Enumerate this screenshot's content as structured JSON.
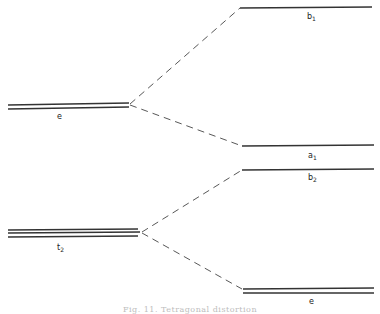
{
  "diagram": {
    "type": "energy-level splitting diagram",
    "left_levels": [
      {
        "id": "e",
        "label": "e",
        "degeneracy": 2
      },
      {
        "id": "t2",
        "label": "t",
        "subscript": "2",
        "degeneracy": 3
      }
    ],
    "right_levels": [
      {
        "id": "b1",
        "label": "b",
        "subscript": "1",
        "degeneracy": 1,
        "from": "e"
      },
      {
        "id": "a1",
        "label": "a",
        "subscript": "1",
        "degeneracy": 1,
        "from": "e"
      },
      {
        "id": "b2",
        "label": "b",
        "subscript": "2",
        "degeneracy": 1,
        "from": "t2"
      },
      {
        "id": "e2",
        "label": "e",
        "degeneracy": 2,
        "from": "t2"
      }
    ],
    "connectors": "dashed",
    "caption": "Fig. 11. Tetragonal distortion"
  },
  "colors": {
    "line": "#333333",
    "text": "#222222",
    "caption": "#bdbdbd"
  }
}
